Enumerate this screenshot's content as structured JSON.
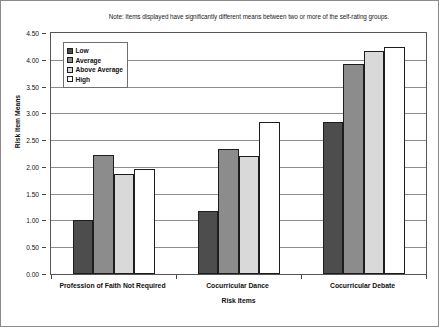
{
  "chart_data": {
    "type": "bar",
    "title": "",
    "note": "Note: Items displayed have significantly different means between two or more of the self-rating groups.",
    "xlabel": "Risk Items",
    "ylabel": "Risk Item Means",
    "ylim": [
      0.0,
      4.5
    ],
    "ytick_step": 0.5,
    "ytick_labels": [
      "0.00",
      "0.50",
      "1.00",
      "1.50",
      "2.00",
      "2.50",
      "3.00",
      "3.50",
      "4.00",
      "4.50"
    ],
    "ytick_values": [
      0.0,
      0.5,
      1.0,
      1.5,
      2.0,
      2.5,
      3.0,
      3.5,
      4.0,
      4.5
    ],
    "grid": "horizontal",
    "legend_position": "upper-left-inside",
    "categories": [
      "Profession of Faith Not Required",
      "Cocurricular Dance",
      "Cocurricular Debate"
    ],
    "series": [
      {
        "name": "Low",
        "color": "#4d4d4d",
        "values": [
          1.0,
          1.18,
          2.84
        ]
      },
      {
        "name": "Average",
        "color": "#8c8c8c",
        "values": [
          2.22,
          2.33,
          3.92
        ]
      },
      {
        "name": "Above Average",
        "color": "#d9d9d9",
        "values": [
          1.87,
          2.2,
          4.17
        ]
      },
      {
        "name": "High",
        "color": "#ffffff",
        "values": [
          1.97,
          2.83,
          4.24
        ]
      }
    ]
  }
}
